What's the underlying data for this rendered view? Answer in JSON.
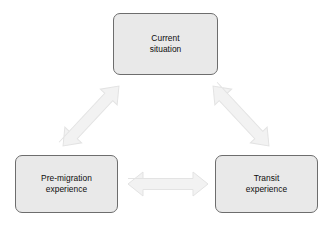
{
  "diagram": {
    "type": "triangular-cycle",
    "background_color": "#ffffff",
    "node_fill_color": "#e9e9e9",
    "node_border_color": "#6d6d6d",
    "arrow_fill_color": "#f2f2f2",
    "arrow_edge_color": "#e2e2e2",
    "text_color": "#0d0d0d",
    "nodes": [
      {
        "id": "current-situation",
        "label": "Current\nsituation",
        "position": "top"
      },
      {
        "id": "pre-migration",
        "label": "Pre-migration\nexperience",
        "position": "bottom-left"
      },
      {
        "id": "transit",
        "label": "Transit\nexperience",
        "position": "bottom-right"
      }
    ],
    "connectors": [
      {
        "id": "pre-migration-to-current-situation",
        "from": "pre-migration",
        "to": "current-situation",
        "style": "double-headed-block-arrow",
        "orientation": "diagonal-up-right"
      },
      {
        "id": "current-situation-to-transit",
        "from": "current-situation",
        "to": "transit",
        "style": "double-headed-block-arrow",
        "orientation": "diagonal-down-right"
      },
      {
        "id": "pre-migration-to-transit",
        "from": "pre-migration",
        "to": "transit",
        "style": "double-headed-block-arrow",
        "orientation": "horizontal"
      }
    ]
  }
}
